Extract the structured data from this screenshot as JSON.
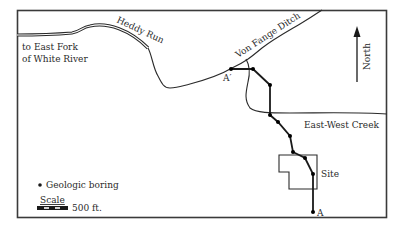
{
  "map": {
    "labels": {
      "heddy_run": "Heddy Run",
      "east_fork_line1": "to East Fork",
      "east_fork_line2": "of White River",
      "von_fange_ditch": "Von Fange Ditch",
      "east_west_creek": "East-West Creek",
      "north": "North",
      "site": "Site",
      "section_start": "A",
      "section_end": "A′"
    },
    "legend": {
      "boring_label": "Geologic boring",
      "scale_title": "Scale",
      "scale_value": "500 ft."
    },
    "colors": {
      "line": "#2a2a2a",
      "frame": "#3a3a3a",
      "background": "#ffffff"
    },
    "borings_count": 10
  }
}
